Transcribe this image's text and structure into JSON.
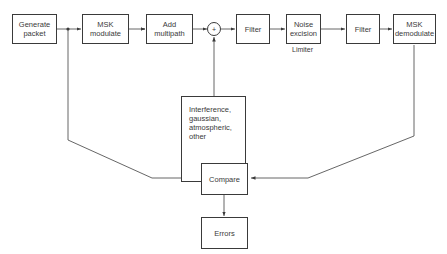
{
  "diagram": {
    "type": "block-diagram",
    "blocks": {
      "generate_packet": "Generate\npacket",
      "msk_modulate": "MSK\nmodulate",
      "add_multipath": "Add\nmultipath",
      "summer": "+",
      "filter1": "Filter",
      "noise_excision": "Noise\nexcision",
      "filter2": "Filter",
      "msk_demodulate": "MSK\ndemodulate",
      "interference": "Interference,\ngaussian,\natmospheric,\nother",
      "compare": "Compare",
      "errors": "Errors"
    },
    "annotations": {
      "limiter": "Limiter"
    },
    "connections": [
      [
        "Generate packet",
        "MSK modulate"
      ],
      [
        "MSK modulate",
        "Add multipath"
      ],
      [
        "Add multipath",
        "+"
      ],
      [
        "Interference, gaussian, atmospheric, other",
        "+"
      ],
      [
        "+",
        "Filter"
      ],
      [
        "Filter",
        "Noise excision"
      ],
      [
        "Noise excision",
        "Filter"
      ],
      [
        "Filter",
        "MSK demodulate"
      ],
      [
        "Generate packet",
        "Compare"
      ],
      [
        "MSK demodulate",
        "Compare"
      ],
      [
        "Compare",
        "Errors"
      ]
    ]
  }
}
